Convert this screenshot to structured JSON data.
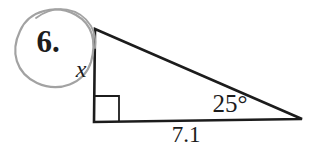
{
  "diagram": {
    "problem_number": "6.",
    "side_label": "x",
    "angle_label": "25°",
    "base_label": "7.1"
  },
  "colors": {
    "ink": "#1c1c1c",
    "pencil": "#a2a2a2",
    "background": "#ffffff"
  }
}
